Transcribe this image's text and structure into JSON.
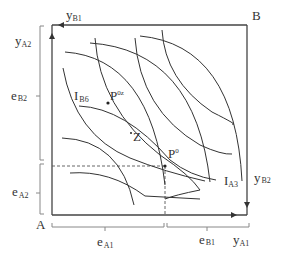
{
  "diagram": {
    "type": "edgeworth-box",
    "corners": {
      "origin_a": "A",
      "origin_b": "B"
    },
    "axis_labels": {
      "top": {
        "main": "y",
        "sub": "B1"
      },
      "left_top": {
        "main": "y",
        "sub": "A2"
      },
      "left_mid": {
        "main": "e",
        "sub": "B2"
      },
      "left_low": {
        "main": "e",
        "sub": "A2"
      },
      "right": {
        "main": "y",
        "sub": "B2"
      },
      "bottom_left": {
        "main": "e",
        "sub": "A1"
      },
      "bottom_mid": {
        "main": "e",
        "sub": "B1"
      },
      "bottom_right": {
        "main": "y",
        "sub": "A1"
      }
    },
    "curve_labels": {
      "ib6": {
        "main": "I",
        "sub": "B6"
      },
      "ia3": {
        "main": "I",
        "sub": "A3"
      }
    },
    "points": {
      "p0z": {
        "main": "P",
        "sup": "0z"
      },
      "p0": {
        "main": "P",
        "sup": "0"
      },
      "z": {
        "main": "Z"
      }
    },
    "colors": {
      "line": "#333333",
      "bracket": "#777777"
    }
  }
}
